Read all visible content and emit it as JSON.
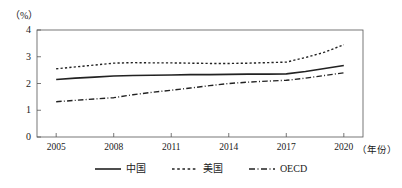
{
  "chart_data": {
    "type": "line",
    "title": "",
    "xlabel": "（年份）",
    "ylabel": "（%）",
    "x": [
      2005,
      2006,
      2007,
      2008,
      2009,
      2010,
      2011,
      2012,
      2013,
      2014,
      2015,
      2016,
      2017,
      2018,
      2019,
      2020
    ],
    "tick_labels_x": [
      "2005",
      "2008",
      "2011",
      "2014",
      "2017",
      "2020"
    ],
    "tick_values_x": [
      2005,
      2008,
      2011,
      2014,
      2017,
      2020
    ],
    "tick_labels_y": [
      "0",
      "1",
      "2",
      "3",
      "4"
    ],
    "tick_values_y": [
      0,
      1,
      2,
      3,
      4
    ],
    "xlim": [
      2004,
      2021
    ],
    "ylim": [
      0,
      4
    ],
    "grid": false,
    "legend_position": "bottom-center",
    "series": [
      {
        "name": "中国",
        "style": "solid",
        "color": "#222222",
        "values": [
          2.15,
          2.2,
          2.24,
          2.28,
          2.3,
          2.31,
          2.32,
          2.33,
          2.33,
          2.34,
          2.35,
          2.35,
          2.36,
          2.45,
          2.56,
          2.67
        ]
      },
      {
        "name": "美国",
        "style": "dotted",
        "color": "#222222",
        "values": [
          2.55,
          2.62,
          2.69,
          2.76,
          2.78,
          2.77,
          2.77,
          2.76,
          2.75,
          2.75,
          2.76,
          2.78,
          2.8,
          2.97,
          3.17,
          3.45
        ]
      },
      {
        "name": "OECD",
        "style": "dashdot",
        "color": "#222222",
        "values": [
          1.32,
          1.37,
          1.42,
          1.47,
          1.58,
          1.67,
          1.75,
          1.83,
          1.92,
          2.0,
          2.05,
          2.09,
          2.12,
          2.2,
          2.3,
          2.4
        ]
      }
    ]
  },
  "legend": {
    "items": [
      {
        "label": "中国"
      },
      {
        "label": "美国"
      },
      {
        "label": "OECD"
      }
    ]
  }
}
